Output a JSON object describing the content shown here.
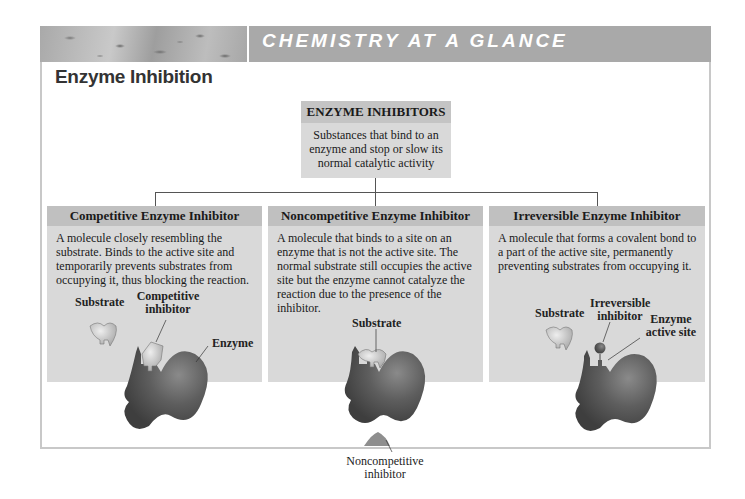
{
  "banner": {
    "title": "CHEMISTRY AT A GLANCE"
  },
  "page": {
    "title": "Enzyme Inhibition"
  },
  "root": {
    "title": "ENZYME INHIBITORS",
    "description": "Substances that bind to an enzyme and stop or slow its normal catalytic activity"
  },
  "cards": [
    {
      "title": "Competitive Enzyme Inhibitor",
      "description": "A molecule closely resembling the substrate. Binds to the active site and temporarily prevents substrates from occupying it, thus blocking the reaction.",
      "labels": {
        "substrate": "Substrate",
        "inhibitor": "Competitive inhibitor",
        "enzyme": "Enzyme"
      }
    },
    {
      "title": "Noncompetitive Enzyme Inhibitor",
      "description": "A molecule that binds to a site on an enzyme that is not the active site. The normal substrate still occupies the active site but the enzyme cannot catalyze the reaction due to the presence of the inhibitor.",
      "labels": {
        "substrate": "Substrate",
        "inhibitor": "Noncompetitive inhibitor"
      }
    },
    {
      "title": "Irreversible Enzyme Inhibitor",
      "description": "A molecule that forms a covalent bond to a part of the active site, permanently preventing substrates from occupying it.",
      "labels": {
        "substrate": "Substrate",
        "inhibitor": "Irreversible inhibitor",
        "enzyme": "Enzyme active site"
      }
    }
  ],
  "colors": {
    "banner": "#a9a9a9",
    "box_fill": "#d9d9d9",
    "box_header": "#c0c0c0",
    "enzyme": "#5a5a5a",
    "substrate": "#c8c8c8"
  }
}
